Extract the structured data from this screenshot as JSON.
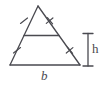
{
  "figure": {
    "kind": "geometry-diagram",
    "background_color": "#ffffff",
    "stroke_color": "#4a4a50",
    "stroke_width": 1.3,
    "labels": {
      "base": "b",
      "height": "h"
    },
    "geometry": {
      "apex": {
        "x": 38,
        "y": 6
      },
      "bottom_left": {
        "x": 10,
        "y": 65
      },
      "bottom_right": {
        "x": 80,
        "y": 65
      },
      "midsegment_left": {
        "x": 24,
        "y": 35.5
      },
      "midsegment_right": {
        "x": 59,
        "y": 35.5
      }
    },
    "tick_marks": [
      {
        "name": "upper-left-tick",
        "count": 1,
        "x": 24,
        "y": 20.7
      },
      {
        "name": "upper-right-tick",
        "count": 2,
        "x": 49.5,
        "y": 20.7
      },
      {
        "name": "lower-left-tick",
        "count": 1,
        "x": 17,
        "y": 50.3
      },
      {
        "name": "lower-right-tick",
        "count": 2,
        "x": 69.5,
        "y": 50.3
      }
    ],
    "dimension_line": {
      "name": "height-dimension",
      "x": 88,
      "y_top": 33.5,
      "y_bottom": 66,
      "cap_half_width": 5
    }
  }
}
